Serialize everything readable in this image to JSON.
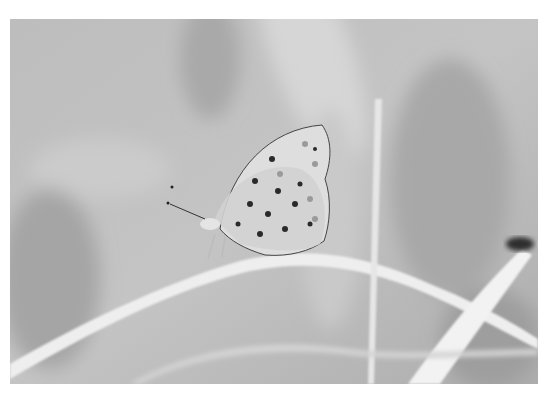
{
  "photo": {
    "subject": "butterfly perched on grass blade",
    "tone": "grayscale",
    "colors": {
      "background": "#b9b9b9",
      "light_bg": "#cfcfcf",
      "dark_bg": "#a3a3a3",
      "grass": "#eeeeee",
      "wing": "#dcdcdc",
      "spot": "#2a2a2a"
    }
  }
}
